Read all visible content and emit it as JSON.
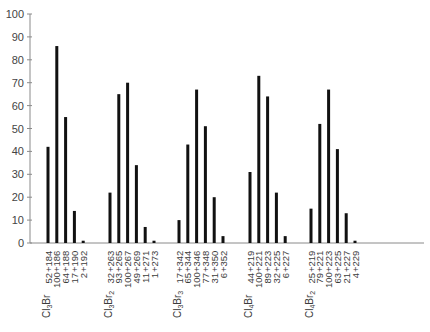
{
  "chart_data": {
    "type": "bar",
    "title": "",
    "xlabel": "",
    "ylabel": "",
    "ylim": [
      0,
      100
    ],
    "yticks": [
      0,
      10,
      20,
      30,
      40,
      50,
      60,
      70,
      80,
      90,
      100
    ],
    "grid": false,
    "legend": null,
    "colors": {
      "bars": "#111111",
      "axis": "#8a8a8a",
      "text": "#3c3c3c"
    },
    "groups": [
      {
        "formula": "Cl3Br",
        "formula_parts": [
          [
            "Cl",
            ""
          ],
          [
            "3",
            "sub"
          ],
          [
            "Br",
            ""
          ]
        ],
        "peaks": [
          {
            "mass": "+184",
            "abundance_label": "52",
            "bar_height": 42
          },
          {
            "mass": "+186",
            "abundance_label": "100",
            "bar_height": 86
          },
          {
            "mass": "+188",
            "abundance_label": "64",
            "bar_height": 55
          },
          {
            "mass": "+190",
            "abundance_label": "17",
            "bar_height": 14
          },
          {
            "mass": "+192",
            "abundance_label": "2",
            "bar_height": 1
          }
        ]
      },
      {
        "formula": "Cl3Br2",
        "formula_parts": [
          [
            "Cl",
            ""
          ],
          [
            "3",
            "sub"
          ],
          [
            "Br",
            ""
          ],
          [
            "2",
            "sub"
          ]
        ],
        "peaks": [
          {
            "mass": "+263",
            "abundance_label": "32",
            "bar_height": 22
          },
          {
            "mass": "+265",
            "abundance_label": "93",
            "bar_height": 65
          },
          {
            "mass": "+267",
            "abundance_label": "100",
            "bar_height": 70
          },
          {
            "mass": "+269",
            "abundance_label": "49",
            "bar_height": 34
          },
          {
            "mass": "+271",
            "abundance_label": "11",
            "bar_height": 7
          },
          {
            "mass": "+273",
            "abundance_label": "1",
            "bar_height": 1
          }
        ]
      },
      {
        "formula": "Cl3Br3",
        "formula_parts": [
          [
            "Cl",
            ""
          ],
          [
            "3",
            "sub"
          ],
          [
            "Br",
            ""
          ],
          [
            "3",
            "sub"
          ]
        ],
        "peaks": [
          {
            "mass": "+342",
            "abundance_label": "17",
            "bar_height": 10
          },
          {
            "mass": "+344",
            "abundance_label": "65",
            "bar_height": 43
          },
          {
            "mass": "+346",
            "abundance_label": "100",
            "bar_height": 67
          },
          {
            "mass": "+348",
            "abundance_label": "77",
            "bar_height": 51
          },
          {
            "mass": "+350",
            "abundance_label": "31",
            "bar_height": 20
          },
          {
            "mass": "+352",
            "abundance_label": "6",
            "bar_height": 3
          }
        ]
      },
      {
        "formula": "Cl4Br",
        "formula_parts": [
          [
            "Cl",
            ""
          ],
          [
            "4",
            "sub"
          ],
          [
            "Br",
            ""
          ]
        ],
        "peaks": [
          {
            "mass": "+219",
            "abundance_label": "44",
            "bar_height": 31
          },
          {
            "mass": "+221",
            "abundance_label": "100",
            "bar_height": 73
          },
          {
            "mass": "+223",
            "abundance_label": "89",
            "bar_height": 64
          },
          {
            "mass": "+225",
            "abundance_label": "32",
            "bar_height": 22
          },
          {
            "mass": "+227",
            "abundance_label": "6",
            "bar_height": 3
          }
        ]
      },
      {
        "formula": "Cl4Br2",
        "formula_parts": [
          [
            "Cl",
            ""
          ],
          [
            "4",
            "sub"
          ],
          [
            "Br",
            ""
          ],
          [
            "2",
            "sub"
          ]
        ],
        "peaks": [
          {
            "mass": "+219",
            "abundance_label": "25",
            "bar_height": 15
          },
          {
            "mass": "+221",
            "abundance_label": "79",
            "bar_height": 52
          },
          {
            "mass": "+223",
            "abundance_label": "100",
            "bar_height": 67
          },
          {
            "mass": "+225",
            "abundance_label": "63",
            "bar_height": 41
          },
          {
            "mass": "+227",
            "abundance_label": "21",
            "bar_height": 13
          },
          {
            "mass": "+229",
            "abundance_label": "4",
            "bar_height": 1
          }
        ]
      }
    ],
    "categories": [
      "Cl3Br",
      "Cl3Br2",
      "Cl3Br3",
      "Cl4Br",
      "Cl4Br2"
    ],
    "layout": {
      "axis_x": 30,
      "y0_px": 243,
      "y100_px": 14,
      "xaxis_end_px": 424,
      "group_first_bar_x": [
        48,
        110,
        179,
        250,
        311
      ],
      "bar_spacing_px": 8.8,
      "bar_width_px": 3
    }
  }
}
